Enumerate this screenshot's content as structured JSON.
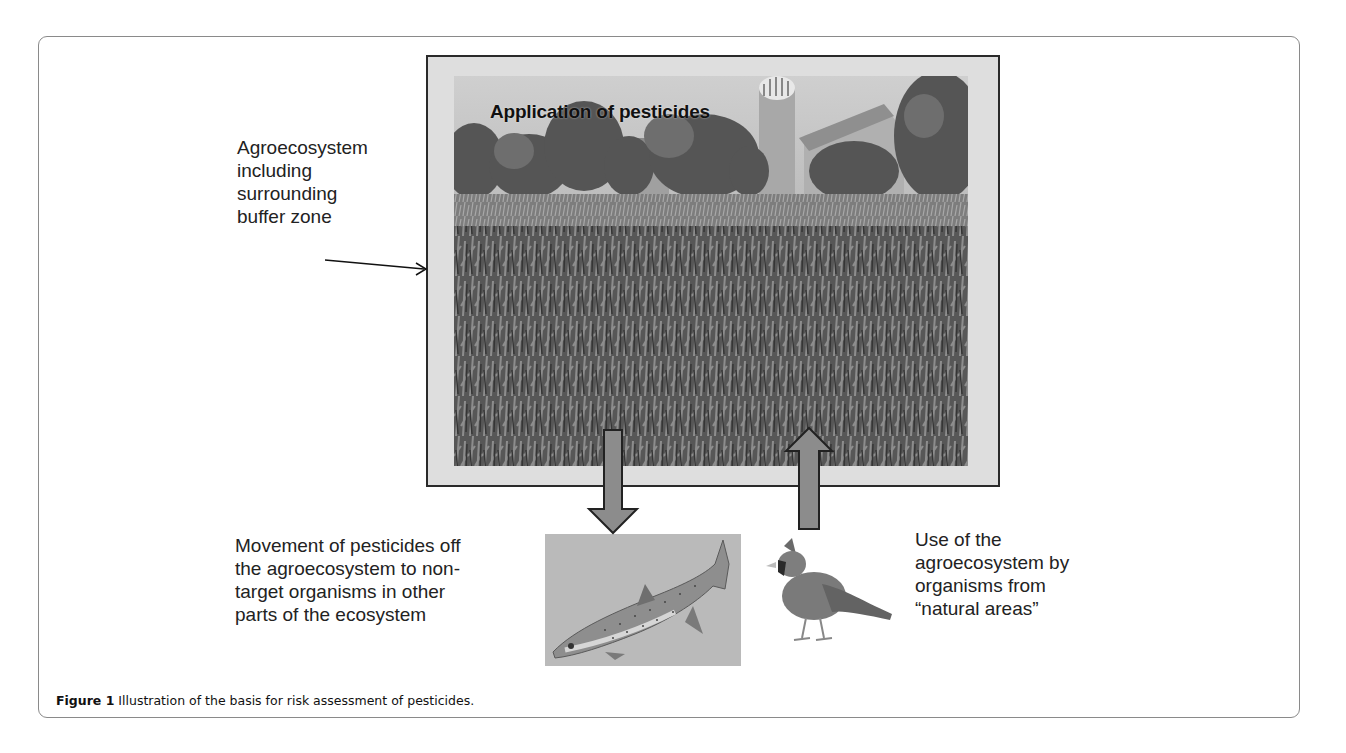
{
  "figure": {
    "photo_title": "Application of pesticides",
    "labels": {
      "agroecosystem": [
        "Agroecosystem",
        "including",
        "surrounding",
        "buffer zone"
      ],
      "movement": [
        "Movement of pesticides off",
        "the agroecosystem to non-",
        "target organisms in other",
        "parts of the ecosystem"
      ],
      "use": [
        "Use of the",
        "agroecosystem by",
        "organisms from",
        "“natural areas”"
      ]
    },
    "images": {
      "main_photo": "farm-cornfield-photo",
      "fish": "trout-fish-illustration",
      "bird": "cardinal-bird-illustration"
    },
    "arrows": {
      "down": "pesticide-movement-arrow",
      "up": "organism-use-arrow",
      "pointer": "buffer-zone-pointer"
    }
  },
  "caption": {
    "label": "Figure 1",
    "text": " Illustration of the basis for risk assessment of pesticides."
  },
  "colors": {
    "frame_border": "#8a8a8a",
    "photo_mat": "#dedede",
    "arrow_fill": "#8c8c8c",
    "text": "#222222"
  }
}
